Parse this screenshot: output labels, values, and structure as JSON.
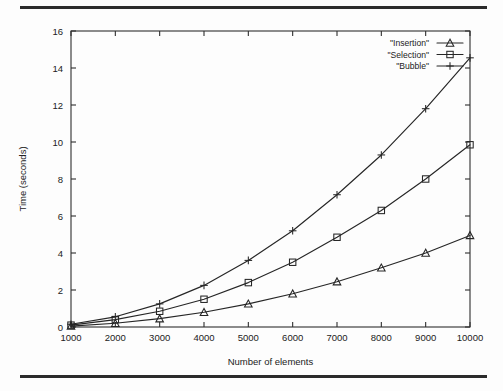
{
  "figure": {
    "rule_top": "horizontal-rule",
    "rule_bottom": "horizontal-rule"
  },
  "chart_data": {
    "type": "line",
    "title": "",
    "xlabel": "Number of elements",
    "ylabel": "Time (seconds)",
    "xlim": [
      1000,
      10000
    ],
    "ylim": [
      0,
      16
    ],
    "xticks": [
      1000,
      2000,
      3000,
      4000,
      5000,
      6000,
      7000,
      8000,
      9000,
      10000
    ],
    "yticks": [
      0,
      2,
      4,
      6,
      8,
      10,
      12,
      14,
      16
    ],
    "xticklabels": [
      "1000",
      "2000",
      "3000",
      "4000",
      "5000",
      "6000",
      "7000",
      "8000",
      "9000",
      "10000"
    ],
    "yticklabels": [
      "0",
      "2",
      "4",
      "6",
      "8",
      "10",
      "12",
      "14",
      "16"
    ],
    "grid": false,
    "legend_position": "top-right",
    "x": [
      1000,
      2000,
      3000,
      4000,
      5000,
      6000,
      7000,
      8000,
      9000,
      10000
    ],
    "series": [
      {
        "name": "\"Insertion\"",
        "marker": "triangle",
        "values": [
          0.05,
          0.2,
          0.45,
          0.8,
          1.25,
          1.8,
          2.45,
          3.2,
          4.0,
          4.95
        ]
      },
      {
        "name": "\"Selection\"",
        "marker": "square",
        "values": [
          0.1,
          0.4,
          0.85,
          1.5,
          2.4,
          3.5,
          4.85,
          6.3,
          8.0,
          9.85
        ]
      },
      {
        "name": "\"Bubble\"",
        "marker": "cross",
        "values": [
          0.15,
          0.55,
          1.25,
          2.25,
          3.6,
          5.2,
          7.15,
          9.3,
          11.8,
          14.55
        ]
      }
    ]
  }
}
